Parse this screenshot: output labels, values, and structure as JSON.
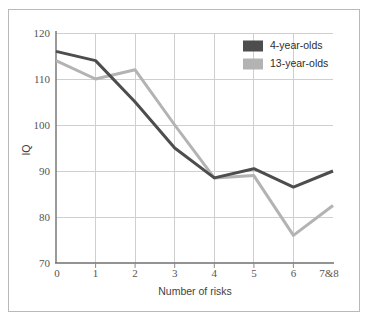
{
  "chart_data": {
    "type": "line",
    "title": "",
    "xlabel": "Number of risks",
    "ylabel": "IQ",
    "x": [
      0,
      1,
      2,
      3,
      4,
      5,
      6,
      7
    ],
    "xtick_labels": [
      "0",
      "1",
      "2",
      "3",
      "4",
      "5",
      "6",
      "7&8"
    ],
    "ytick_labels": [
      "70",
      "80",
      "90",
      "100",
      "110",
      "120"
    ],
    "yticks": [
      70,
      80,
      90,
      100,
      110,
      120
    ],
    "xlim": [
      0,
      7
    ],
    "ylim": [
      70,
      120
    ],
    "grid": true,
    "legend_position": "top-right",
    "series": [
      {
        "name": "4-year-olds",
        "color": "#4d4d4d",
        "values": [
          116,
          114,
          105,
          95,
          88.5,
          90.5,
          86.5,
          90
        ]
      },
      {
        "name": "13-year-olds",
        "color": "#b3b3b3",
        "values": [
          114,
          110,
          112,
          100,
          88.5,
          89,
          76,
          82.5
        ]
      }
    ]
  },
  "legend": {
    "entries": [
      {
        "label": "4-year-olds",
        "swatch_color": "#4d4d4d"
      },
      {
        "label": "13-year-olds",
        "swatch_color": "#b3b3b3"
      }
    ]
  },
  "axes": {
    "y_title": "IQ",
    "x_title": "Number of risks"
  },
  "colors": {
    "frame_border": "#b9b9b9",
    "gridline": "#cfcfcf",
    "axis": "#6f6f6f",
    "background": "#ffffff",
    "tick_text": "#555555"
  }
}
